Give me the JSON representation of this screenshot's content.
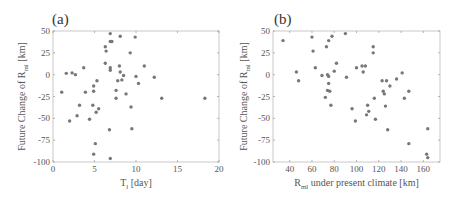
{
  "chart_data": [
    {
      "type": "scatter",
      "panel_label": "(a)",
      "xlabel": "T_l [day]",
      "xlabel_main": "T",
      "xlabel_sub": "l",
      "xlabel_rest": " [day]",
      "ylabel": "Future Change of R_ml [km]",
      "ylabel_main": "Future Change of R",
      "ylabel_sub": "ml",
      "ylabel_rest": " [km]",
      "xlim": [
        0,
        20
      ],
      "ylim": [
        -100,
        50
      ],
      "xticks": [
        0,
        5,
        10,
        15,
        20
      ],
      "yticks": [
        50,
        25,
        0,
        -25,
        -50,
        -75,
        -100
      ],
      "marker_color": "#777777",
      "points": [
        [
          1.05,
          -20
        ],
        [
          1.6,
          1.5
        ],
        [
          2.3,
          2
        ],
        [
          2.7,
          0
        ],
        [
          3.7,
          8
        ],
        [
          2.0,
          -53
        ],
        [
          2.9,
          -47
        ],
        [
          3.2,
          -35
        ],
        [
          3.9,
          -20
        ],
        [
          4.4,
          -51
        ],
        [
          4.8,
          -35
        ],
        [
          4.9,
          -13
        ],
        [
          4.9,
          -19
        ],
        [
          5.3,
          -7
        ],
        [
          5.2,
          -43
        ],
        [
          5.5,
          -39
        ],
        [
          5.1,
          -79
        ],
        [
          4.9,
          -91
        ],
        [
          6.3,
          32
        ],
        [
          6.4,
          27
        ],
        [
          6.3,
          13
        ],
        [
          6.9,
          47
        ],
        [
          6.9,
          38
        ],
        [
          7.1,
          38
        ],
        [
          6.9,
          8
        ],
        [
          6.9,
          5
        ],
        [
          6.8,
          -63
        ],
        [
          6.9,
          -96
        ],
        [
          8.1,
          44
        ],
        [
          9.9,
          43
        ],
        [
          8.0,
          10
        ],
        [
          8.1,
          3
        ],
        [
          8.5,
          -1
        ],
        [
          8.3,
          -6
        ],
        [
          7.8,
          -7
        ],
        [
          7.6,
          -18
        ],
        [
          7.6,
          -27
        ],
        [
          8.8,
          -22
        ],
        [
          9.3,
          25
        ],
        [
          9.4,
          -37
        ],
        [
          9.5,
          -62
        ],
        [
          10.0,
          -2
        ],
        [
          10.3,
          -10
        ],
        [
          11.0,
          10
        ],
        [
          12.2,
          -3
        ],
        [
          13.1,
          -27
        ],
        [
          18.3,
          -27
        ]
      ]
    },
    {
      "type": "scatter",
      "panel_label": "(b)",
      "xlabel": "R_ml under present climate [km]",
      "xlabel_main": "R",
      "xlabel_sub": "ml",
      "xlabel_rest": " under present climate [km]",
      "ylabel": "Future Change of R_ml [km]",
      "ylabel_main": "Future Change of R",
      "ylabel_sub": "ml",
      "ylabel_rest": " [km]",
      "xlim": [
        25,
        175
      ],
      "ylim": [
        -100,
        50
      ],
      "xticks": [
        40,
        60,
        80,
        100,
        120,
        140,
        160
      ],
      "yticks": [
        50,
        25,
        0,
        -25,
        -50,
        -75,
        -100
      ],
      "marker_color": "#777777",
      "points": [
        [
          34,
          39
        ],
        [
          46,
          3
        ],
        [
          48,
          -7
        ],
        [
          60,
          43
        ],
        [
          61,
          27
        ],
        [
          63,
          8
        ],
        [
          69,
          -1
        ],
        [
          72,
          -26
        ],
        [
          73,
          32
        ],
        [
          74,
          0
        ],
        [
          75,
          39
        ],
        [
          75,
          -2
        ],
        [
          75,
          -10
        ],
        [
          74,
          -18
        ],
        [
          76,
          -19
        ],
        [
          77,
          -35
        ],
        [
          78,
          44
        ],
        [
          80,
          4
        ],
        [
          82,
          13
        ],
        [
          90,
          47
        ],
        [
          91,
          -3
        ],
        [
          96,
          -39
        ],
        [
          99,
          -53
        ],
        [
          100,
          8
        ],
        [
          105,
          10
        ],
        [
          106,
          3
        ],
        [
          108,
          10
        ],
        [
          109,
          -46
        ],
        [
          110,
          -35
        ],
        [
          111,
          -42
        ],
        [
          115,
          25
        ],
        [
          115,
          32
        ],
        [
          116,
          -27
        ],
        [
          117,
          -51
        ],
        [
          123,
          -7
        ],
        [
          124,
          -19
        ],
        [
          125,
          -22
        ],
        [
          126,
          -36
        ],
        [
          127,
          -7
        ],
        [
          128,
          -63
        ],
        [
          130,
          -13
        ],
        [
          136,
          -5
        ],
        [
          141,
          2
        ],
        [
          143,
          -27
        ],
        [
          147,
          -79
        ],
        [
          147,
          -19
        ],
        [
          163,
          -91
        ],
        [
          164,
          -95
        ],
        [
          164,
          -62
        ]
      ]
    }
  ]
}
